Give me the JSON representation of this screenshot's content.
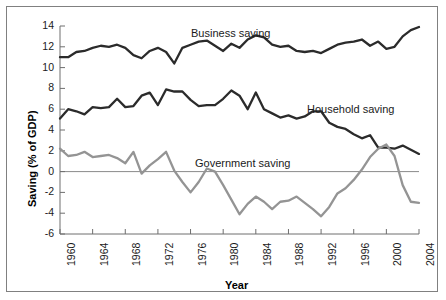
{
  "chart_data": {
    "type": "line",
    "title": "",
    "xlabel": "Year",
    "ylabel": "Saving (% of GDP)",
    "xlim": [
      1960,
      2004
    ],
    "ylim": [
      -6,
      14
    ],
    "grid": false,
    "zero_line": true,
    "legend_position": "inline-annotations",
    "x": [
      1960,
      1961,
      1962,
      1963,
      1964,
      1965,
      1966,
      1967,
      1968,
      1969,
      1970,
      1971,
      1972,
      1973,
      1974,
      1975,
      1976,
      1977,
      1978,
      1979,
      1980,
      1981,
      1982,
      1983,
      1984,
      1985,
      1986,
      1987,
      1988,
      1989,
      1990,
      1991,
      1992,
      1993,
      1994,
      1995,
      1996,
      1997,
      1998,
      1999,
      2000,
      2001,
      2002,
      2003,
      2004
    ],
    "xticks": [
      1960,
      1964,
      1968,
      1972,
      1976,
      1980,
      1984,
      1988,
      1992,
      1996,
      2000,
      2004
    ],
    "xtick_labels": [
      "1960",
      "1964",
      "1968",
      "1972",
      "1976",
      "1980",
      "1984",
      "1988",
      "1992",
      "1996",
      "2000",
      "2004"
    ],
    "yticks": [
      14,
      12,
      10,
      8,
      6,
      4,
      2,
      0,
      -2,
      -4,
      -6
    ],
    "ytick_labels": [
      "14",
      "12",
      "10",
      "8",
      "6",
      "4",
      "2",
      "0",
      "-2",
      "-4",
      "-6"
    ],
    "series": [
      {
        "name": "Business saving",
        "color": "#2b2b2b",
        "width": 2.3,
        "label_x": 184,
        "label_y": 20,
        "values": [
          11.0,
          11.0,
          11.5,
          11.6,
          11.9,
          12.1,
          12.0,
          12.2,
          11.9,
          11.2,
          10.9,
          11.6,
          11.9,
          11.5,
          10.4,
          11.9,
          12.2,
          12.5,
          12.6,
          12.1,
          11.6,
          12.3,
          11.9,
          12.7,
          13.1,
          12.9,
          12.2,
          12.0,
          12.1,
          11.6,
          11.5,
          11.6,
          11.4,
          11.8,
          12.2,
          12.4,
          12.5,
          12.7,
          12.1,
          12.5,
          11.8,
          12.0,
          13.0,
          13.6,
          13.9
        ]
      },
      {
        "name": "Household saving",
        "color": "#2b2b2b",
        "width": 2.3,
        "label_x": 300,
        "label_y": 96,
        "values": [
          5.1,
          6.0,
          5.8,
          5.5,
          6.2,
          6.1,
          6.2,
          7.0,
          6.2,
          6.3,
          7.3,
          7.6,
          6.4,
          7.9,
          7.7,
          7.7,
          6.9,
          6.3,
          6.4,
          6.4,
          7.0,
          7.8,
          7.3,
          6.0,
          7.6,
          6.0,
          5.6,
          5.2,
          5.4,
          5.1,
          5.3,
          5.8,
          5.8,
          4.7,
          4.3,
          4.1,
          3.6,
          3.2,
          3.5,
          2.3,
          2.3,
          2.2,
          2.5,
          2.1,
          1.7
        ]
      },
      {
        "name": "Government saving",
        "color": "#949494",
        "width": 2.3,
        "label_x": 188,
        "label_y": 150,
        "values": [
          2.2,
          1.5,
          1.6,
          1.9,
          1.4,
          1.5,
          1.6,
          1.3,
          0.8,
          1.9,
          -0.2,
          0.6,
          1.2,
          1.9,
          0.1,
          -1.0,
          -2.0,
          -1.0,
          0.3,
          0.0,
          -1.3,
          -2.7,
          -4.1,
          -3.1,
          -2.4,
          -2.9,
          -3.6,
          -2.9,
          -2.8,
          -2.4,
          -3.0,
          -3.6,
          -4.3,
          -3.4,
          -2.1,
          -1.6,
          -0.8,
          0.2,
          1.4,
          2.2,
          2.6,
          1.5,
          -1.3,
          -2.9,
          -3.0
        ]
      }
    ]
  },
  "annotations": {
    "business": "Business saving",
    "household": "Household saving",
    "government": "Government saving"
  }
}
